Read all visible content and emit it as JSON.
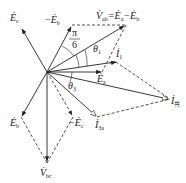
{
  "diagram": {
    "type": "phasor-diagram",
    "origin": [
      47,
      72
    ],
    "phasors": [
      {
        "id": "Ec",
        "label": "Ė",
        "sub": "c",
        "prefix": "",
        "end": [
          22,
          28
        ],
        "style": "solid"
      },
      {
        "id": "neg_Eb",
        "label": "Ė",
        "sub": "b",
        "prefix": "−",
        "end": [
          72,
          25
        ],
        "style": "solid"
      },
      {
        "id": "Vab",
        "label": "V̇",
        "sub": "ab",
        "prefix": "",
        "end": [
          126,
          25
        ],
        "style": "solid"
      },
      {
        "id": "I1",
        "label": "İ",
        "sub": "1",
        "prefix": "",
        "end": [
          116,
          62
        ],
        "style": "solid"
      },
      {
        "id": "Ea",
        "label": "Ė",
        "sub": "a",
        "prefix": "",
        "end": [
          102,
          72
        ],
        "style": "solid"
      },
      {
        "id": "Igong",
        "label": "İ",
        "sub": "共",
        "prefix": "",
        "end": [
          170,
          99
        ],
        "style": "solid"
      },
      {
        "id": "I3a",
        "label": "İ",
        "sub": "3a",
        "prefix": "",
        "end": [
          97,
          117
        ],
        "style": "solid"
      },
      {
        "id": "Eb",
        "label": "Ė",
        "sub": "b",
        "prefix": "",
        "end": [
          21,
          117
        ],
        "style": "solid"
      },
      {
        "id": "neg_Ec",
        "label": "Ė",
        "sub": "c",
        "prefix": "−",
        "end": [
          73,
          117
        ],
        "style": "dashed"
      },
      {
        "id": "Vbc",
        "label": "V̇",
        "sub": "bc",
        "prefix": "",
        "end": [
          47,
          163
        ],
        "style": "solid"
      }
    ],
    "labels": {
      "Ec": {
        "main": "Ė",
        "sub": "c"
      },
      "neg_Eb": {
        "prefix": "−",
        "main": "Ė",
        "sub": "b"
      },
      "Vab_eq": {
        "main": "V̇",
        "sub": "ab",
        "rhs": "=Ė",
        "rhs_sub1": "a",
        "minus": "−Ė",
        "rhs_sub2": "b"
      },
      "I1": {
        "main": "İ",
        "sub": "1"
      },
      "Ea": {
        "main": "Ė",
        "sub": "a"
      },
      "Igong": {
        "main": "İ",
        "sub": "共"
      },
      "I3a": {
        "main": "İ",
        "sub": "3a"
      },
      "Eb": {
        "main": "Ė",
        "sub": "b"
      },
      "neg_Ec": {
        "prefix": "−",
        "main": "Ė",
        "sub": "c"
      },
      "Vbc": {
        "main": "V̇",
        "sub": "bc"
      }
    },
    "angles": {
      "pi_over_6": {
        "num": "π",
        "den": "6"
      },
      "theta1": {
        "main": "θ",
        "sub": "1"
      },
      "theta3": {
        "main": "θ",
        "sub": "3"
      }
    }
  }
}
